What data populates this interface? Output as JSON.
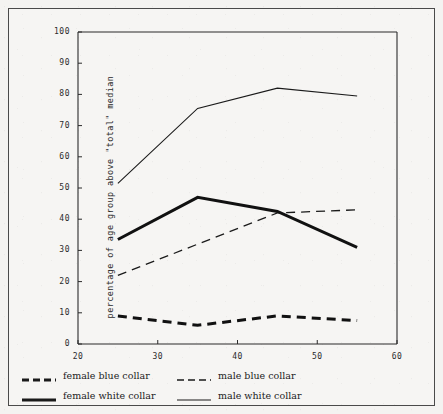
{
  "chart_data": {
    "type": "line",
    "title": "",
    "xlabel": "",
    "ylabel": "percentage of age group above \"total\" median",
    "xlim": [
      20,
      60
    ],
    "ylim": [
      0,
      100
    ],
    "xticks": [
      20,
      30,
      40,
      50,
      60
    ],
    "yticks": [
      0,
      10,
      20,
      30,
      40,
      50,
      60,
      70,
      80,
      90,
      100
    ],
    "grid": false,
    "legend_position": "below-axes",
    "x": [
      25,
      35,
      45,
      55
    ],
    "series": [
      {
        "name": "female blue collar",
        "style": "thick-dashed",
        "color": "#111111",
        "values": [
          9,
          6,
          9,
          7.5
        ]
      },
      {
        "name": "male blue collar",
        "style": "thin-dashed",
        "color": "#1a1a1a",
        "values": [
          22,
          32,
          42,
          43
        ]
      },
      {
        "name": "female white collar",
        "style": "thick-solid",
        "color": "#111111",
        "values": [
          33.5,
          47,
          42.5,
          31
        ]
      },
      {
        "name": "male white collar",
        "style": "thin-solid",
        "color": "#1a1a1a",
        "values": [
          51.5,
          75.5,
          82,
          79.5
        ]
      }
    ]
  },
  "axis": {
    "y_tick_labels": [
      "100",
      "90",
      "80",
      "70",
      "60",
      "50",
      "40",
      "30",
      "20",
      "10",
      "0"
    ],
    "x_tick_labels": [
      "20",
      "30",
      "40",
      "50",
      "60"
    ],
    "y_axis_title": "percentage of age group above \"total\" median"
  },
  "legend": {
    "rows": [
      [
        {
          "label": "female blue collar",
          "swatch": "thick-dashed"
        },
        {
          "label": "male blue collar",
          "swatch": "thin-dashed"
        }
      ],
      [
        {
          "label": "female white collar",
          "swatch": "thick-solid"
        },
        {
          "label": "male white collar",
          "swatch": "thin-solid"
        }
      ]
    ]
  },
  "colors": {
    "background": "#f4f3f1",
    "frame": "#4a4a4a",
    "ink": "#1a1a1a"
  }
}
